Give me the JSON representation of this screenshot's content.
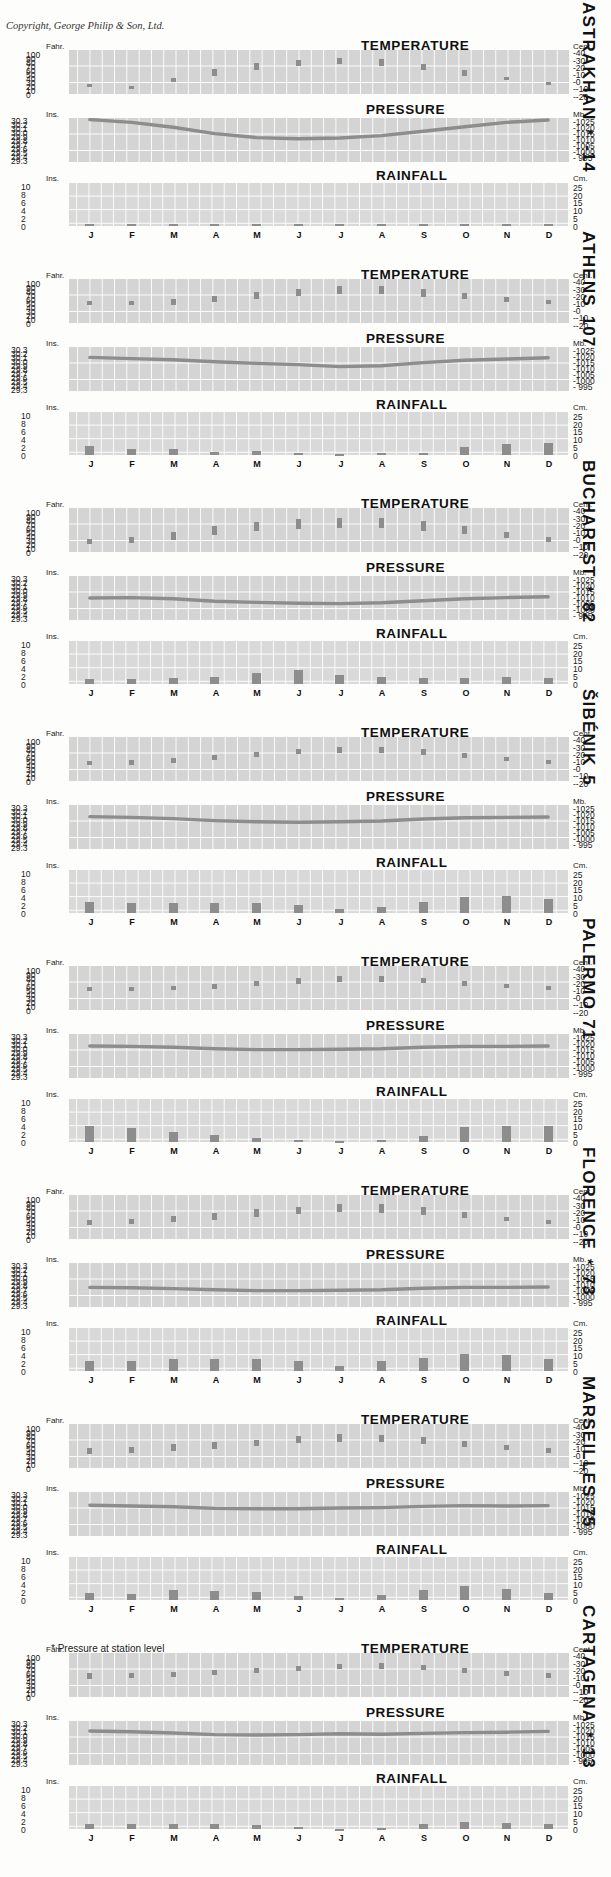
{
  "page": {
    "copyright": "Copyright, George Philip & Son, Ltd.",
    "footnote_symbol": "*",
    "footnote_text": "Pressure at station level"
  },
  "panels": {
    "temperature_title": "TEMPERATURE",
    "pressure_title": "PRESSURE",
    "rainfall_title": "RAINFALL",
    "temp_left_unit": "Fahr.",
    "temp_right_unit": "Cent.",
    "pres_left_unit": "Ins.",
    "pres_right_unit": "Mb.",
    "rain_left_unit": "Ins.",
    "rain_right_unit": "Cm."
  },
  "axes": {
    "temp_fahr": [
      "100",
      "90",
      "80",
      "70",
      "60",
      "50",
      "40",
      "30",
      "20",
      "10",
      "0"
    ],
    "temp_cent": [
      "-40",
      "-30",
      "-20",
      "-10",
      "-0",
      "--10",
      "--20"
    ],
    "temp_fahr_min": 0,
    "temp_fahr_max": 110,
    "pres_ins": [
      "30.3",
      "30.2",
      "30.1",
      "30.0",
      "29.9",
      "29.8",
      "29.7",
      "29.6",
      "29.5",
      "29.4",
      "29.3"
    ],
    "pres_mb": [
      "-1025",
      "-1020",
      "-1015",
      "-1010",
      "-1005",
      "-1000",
      "- 995"
    ],
    "pres_min": 29.25,
    "pres_max": 30.35,
    "rain_ins": [
      "10",
      "8",
      "6",
      "4",
      "2",
      "0"
    ],
    "rain_cm": [
      "25",
      "20",
      "15",
      "10",
      "5",
      "0"
    ],
    "rain_min": 0,
    "rain_max": 11,
    "months": [
      "J",
      "F",
      "M",
      "A",
      "M",
      "J",
      "J",
      "A",
      "S",
      "O",
      "N",
      "D"
    ]
  },
  "chart_data": {
    "type": "bar",
    "xlabel": "Month",
    "ylabel": "Temperature (F/C), Pressure (Ins./Mb.), Rainfall (Ins./Cm.)",
    "cities": [
      {
        "name": "ASTRAKHAN",
        "star": "*",
        "altitude": "-14",
        "temp_low_f": "57.9°F",
        "temp_high_c": "32.2°C",
        "rain_in": "6.4in.",
        "rain_cm": "16.3cm.",
        "temp_min_f": [
          17,
          20,
          29,
          45,
          61,
          69,
          74,
          71,
          60,
          46,
          34,
          24
        ],
        "temp_max_f": [
          25,
          21,
          41,
          62,
          77,
          86,
          90,
          87,
          76,
          60,
          43,
          30
        ],
        "pressure_ins": [
          30.31,
          30.24,
          30.12,
          29.96,
          29.86,
          29.83,
          29.85,
          29.91,
          30.02,
          30.13,
          30.24,
          30.3
        ],
        "rainfall_in": [
          0.5,
          0.4,
          0.4,
          0.5,
          0.6,
          0.6,
          0.5,
          0.4,
          0.4,
          0.5,
          0.5,
          0.5
        ]
      },
      {
        "name": "ATHENS",
        "star": "",
        "altitude": "107",
        "temp_low_f": "33.0°F",
        "temp_high_c": "18.3°C",
        "rain_in": "15.7in.",
        "rain_cm": "39.9cm.",
        "temp_min_f": [
          44,
          44,
          46,
          52,
          60,
          67,
          72,
          72,
          66,
          60,
          53,
          47
        ],
        "temp_max_f": [
          54,
          55,
          60,
          68,
          77,
          86,
          92,
          92,
          84,
          75,
          66,
          58
        ],
        "pressure_ins": [
          30.09,
          30.06,
          30.03,
          29.98,
          29.94,
          29.91,
          29.86,
          29.88,
          29.96,
          30.02,
          30.05,
          30.08
        ],
        "rainfall_in": [
          2.2,
          1.6,
          1.5,
          0.8,
          0.9,
          0.6,
          0.2,
          0.4,
          0.6,
          2.1,
          2.8,
          2.9
        ]
      },
      {
        "name": "BUCHAREST",
        "star": "*",
        "altitude": "82",
        "temp_low_f": "47.0°F",
        "temp_high_c": "26.1°C",
        "rain_in": "22.8in.",
        "rain_cm": "57.9cm.",
        "temp_min_f": [
          20,
          22,
          30,
          43,
          52,
          58,
          61,
          60,
          53,
          44,
          35,
          26
        ],
        "temp_max_f": [
          33,
          37,
          50,
          65,
          75,
          82,
          86,
          85,
          78,
          65,
          49,
          37
        ],
        "pressure_ins": [
          29.8,
          29.81,
          29.78,
          29.72,
          29.69,
          29.67,
          29.66,
          29.68,
          29.73,
          29.78,
          29.81,
          29.83
        ],
        "rainfall_in": [
          1.2,
          1.2,
          1.6,
          1.8,
          2.7,
          3.4,
          2.2,
          1.8,
          1.6,
          1.6,
          1.7,
          1.6
        ]
      },
      {
        "name": "ŠIBÉNIK",
        "star": "",
        "altitude": "5",
        "temp_low_f": "32.5°F",
        "temp_high_c": "18.1°C",
        "rain_in": "32.3in.",
        "rain_cm": "82.0cm.",
        "temp_min_f": [
          40,
          41,
          45,
          52,
          60,
          67,
          71,
          71,
          65,
          57,
          49,
          43
        ],
        "temp_max_f": [
          50,
          52,
          57,
          64,
          73,
          81,
          86,
          86,
          79,
          69,
          60,
          53
        ],
        "pressure_ins": [
          30.06,
          30.04,
          30.01,
          29.96,
          29.93,
          29.92,
          29.93,
          29.95,
          30.0,
          30.03,
          30.04,
          30.05
        ],
        "rainfall_in": [
          2.7,
          2.6,
          2.5,
          2.4,
          2.4,
          2.0,
          1.1,
          1.4,
          2.8,
          3.9,
          4.2,
          3.5
        ]
      },
      {
        "name": "PALERMO",
        "star": "",
        "altitude": "71",
        "temp_low_f": "26.5°F",
        "temp_high_c": "14.7°C",
        "rain_in": "30.7in.",
        "rain_cm": "78.0cm.",
        "temp_min_f": [
          47,
          47,
          49,
          53,
          59,
          65,
          70,
          71,
          68,
          61,
          55,
          50
        ],
        "temp_max_f": [
          57,
          57,
          60,
          65,
          72,
          79,
          84,
          85,
          81,
          73,
          65,
          59
        ],
        "pressure_ins": [
          30.05,
          30.04,
          30.02,
          29.98,
          29.96,
          29.96,
          29.97,
          29.98,
          30.02,
          30.04,
          30.04,
          30.05
        ],
        "rainfall_in": [
          3.9,
          3.6,
          2.4,
          1.8,
          1.0,
          0.4,
          0.2,
          0.5,
          1.5,
          3.8,
          4.1,
          4.0
        ]
      },
      {
        "name": "FLORENCE",
        "star": "*",
        "altitude": "73",
        "temp_low_f": "34.5°F",
        "temp_high_c": "19.2°C",
        "rain_in": "32.7in.",
        "rain_cm": "83.1cm.",
        "temp_min_f": [
          35,
          37,
          42,
          48,
          56,
          62,
          67,
          66,
          61,
          53,
          44,
          38
        ],
        "temp_max_f": [
          47,
          51,
          58,
          66,
          74,
          81,
          88,
          87,
          80,
          68,
          56,
          48
        ],
        "pressure_ins": [
          29.74,
          29.73,
          29.71,
          29.68,
          29.66,
          29.66,
          29.67,
          29.68,
          29.72,
          29.74,
          29.74,
          29.75
        ],
        "rainfall_in": [
          2.5,
          2.4,
          2.9,
          2.9,
          2.9,
          2.4,
          1.2,
          2.4,
          3.2,
          4.2,
          4.0,
          3.0
        ]
      },
      {
        "name": "MARSEILLES",
        "star": "",
        "altitude": "75",
        "temp_low_f": "27.5°F",
        "temp_high_c": "15.3°C",
        "rain_in": "23.2in.",
        "rain_cm": "58.9cm.",
        "temp_min_f": [
          36,
          38,
          42,
          48,
          55,
          62,
          66,
          66,
          60,
          53,
          44,
          38
        ],
        "temp_max_f": [
          50,
          53,
          59,
          64,
          71,
          79,
          84,
          83,
          77,
          67,
          57,
          51
        ],
        "pressure_ins": [
          30.02,
          30.0,
          29.98,
          29.94,
          29.93,
          29.93,
          29.95,
          29.96,
          29.99,
          30.01,
          30.0,
          30.01
        ],
        "rainfall_in": [
          1.7,
          1.4,
          2.4,
          2.3,
          1.9,
          1.1,
          0.6,
          1.2,
          2.6,
          3.4,
          2.8,
          1.8
        ]
      },
      {
        "name": "CARTAGENA",
        "star": "*",
        "altitude": "13",
        "temp_low_f": "25.0°F",
        "temp_high_c": "13.9°C",
        "rain_in": "14.9in.",
        "rain_cm": "37.9cm.",
        "temp_min_f": [
          46,
          47,
          50,
          54,
          59,
          65,
          70,
          71,
          67,
          60,
          53,
          48
        ],
        "temp_max_f": [
          59,
          60,
          63,
          67,
          72,
          78,
          83,
          84,
          80,
          73,
          66,
          61
        ],
        "pressure_ins": [
          30.1,
          30.08,
          30.05,
          30.01,
          30.0,
          30.01,
          30.03,
          30.02,
          30.04,
          30.06,
          30.07,
          30.09
        ],
        "rainfall_in": [
          1.3,
          1.2,
          1.3,
          1.2,
          1.0,
          0.5,
          0.1,
          0.2,
          1.2,
          1.8,
          1.5,
          1.3
        ]
      }
    ]
  }
}
